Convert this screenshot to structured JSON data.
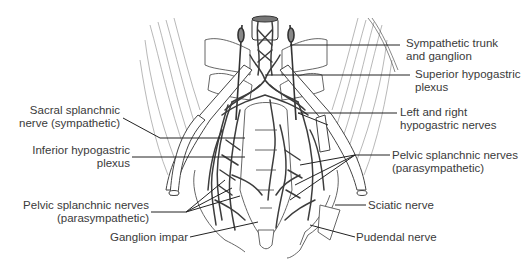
{
  "figure": {
    "labels": {
      "sympathetic_trunk": {
        "line1": "Sympathetic trunk",
        "line2": "and ganglion"
      },
      "superior_hypogastric": {
        "line1": "Superior hypogastric",
        "line2": "plexus"
      },
      "hypogastric_nerves": {
        "line1": "Left and right",
        "line2": "hypogastric nerves"
      },
      "pelvic_splanchnic_right": {
        "line1": "Pelvic splanchnic nerves",
        "line2": "(parasympathetic)"
      },
      "sciatic": {
        "line1": "Sciatic nerve"
      },
      "pudendal": {
        "line1": "Pudendal nerve"
      },
      "sacral_splanchnic": {
        "line1": "Sacral splanchnic",
        "line2": "nerve (sympathetic)"
      },
      "inferior_hypogastric": {
        "line1": "Inferior hypogastric",
        "line2": "plexus"
      },
      "pelvic_splanchnic_left": {
        "line1": "Pelvic splanchnic nerves",
        "line2": "(parasympathetic)"
      },
      "ganglion_impar": {
        "line1": "Ganglion impar"
      }
    },
    "colors": {
      "nerve": "#3d3d3d",
      "outline": "#555555",
      "leader": "#222222",
      "text": "#3a3a3a"
    }
  }
}
